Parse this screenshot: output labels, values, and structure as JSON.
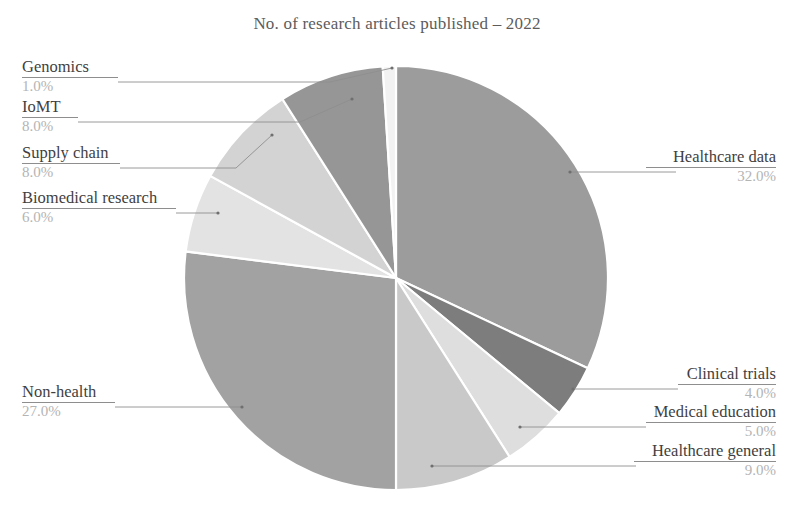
{
  "chart_data": {
    "type": "pie",
    "title": "No. of research articles published – 2022",
    "xlabel": "",
    "ylabel": "",
    "units": "percent",
    "total": 100.0,
    "legend_position": "callout-labels",
    "grid": false,
    "start_angle_deg": 90,
    "direction": "clockwise",
    "categories": [
      "Healthcare data",
      "Clinical trials",
      "Medical education",
      "Healthcare general",
      "Non-health",
      "Biomedical research",
      "Supply chain",
      "IoMT",
      "Genomics"
    ],
    "values": [
      32.0,
      4.0,
      5.0,
      9.0,
      27.0,
      6.0,
      8.0,
      8.0,
      1.0
    ],
    "value_labels": [
      "32.0%",
      "4.0%",
      "5.0%",
      "9.0%",
      "27.0%",
      "6.0%",
      "8.0%",
      "8.0%",
      "1.0%"
    ],
    "colors": [
      "#9c9c9c",
      "#7d7d7d",
      "#dedede",
      "#c9c9c9",
      "#a2a2a2",
      "#e3e3e3",
      "#d3d3d3",
      "#969696",
      "#f2f2f2"
    ],
    "slices": [
      {
        "label": "Healthcare data",
        "value": 32.0,
        "value_label": "32.0%",
        "color": "#9c9c9c"
      },
      {
        "label": "Clinical trials",
        "value": 4.0,
        "value_label": "4.0%",
        "color": "#7d7d7d"
      },
      {
        "label": "Medical education",
        "value": 5.0,
        "value_label": "5.0%",
        "color": "#dedede"
      },
      {
        "label": "Healthcare general",
        "value": 9.0,
        "value_label": "9.0%",
        "color": "#c9c9c9"
      },
      {
        "label": "Non-health",
        "value": 27.0,
        "value_label": "27.0%",
        "color": "#a2a2a2"
      },
      {
        "label": "Biomedical research",
        "value": 6.0,
        "value_label": "6.0%",
        "color": "#e3e3e3"
      },
      {
        "label": "Supply chain",
        "value": 8.0,
        "value_label": "8.0%",
        "color": "#d3d3d3"
      },
      {
        "label": "IoMT",
        "value": 8.0,
        "value_label": "8.0%",
        "color": "#969696"
      },
      {
        "label": "Genomics",
        "value": 1.0,
        "value_label": "1.0%",
        "color": "#f2f2f2"
      }
    ]
  },
  "callouts": {
    "genomics": {
      "label": "Genomics",
      "value_label": "1.0%"
    },
    "iomt": {
      "label": "IoMT",
      "value_label": "8.0%"
    },
    "supply_chain": {
      "label": "Supply chain",
      "value_label": "8.0%"
    },
    "biomedical_research": {
      "label": "Biomedical research",
      "value_label": "6.0%"
    },
    "non_health": {
      "label": "Non-health",
      "value_label": "27.0%"
    },
    "healthcare_data": {
      "label": "Healthcare data",
      "value_label": "32.0%"
    },
    "clinical_trials": {
      "label": "Clinical trials",
      "value_label": "4.0%"
    },
    "medical_education": {
      "label": "Medical education",
      "value_label": "5.0%"
    },
    "healthcare_general": {
      "label": "Healthcare general",
      "value_label": "9.0%"
    }
  }
}
